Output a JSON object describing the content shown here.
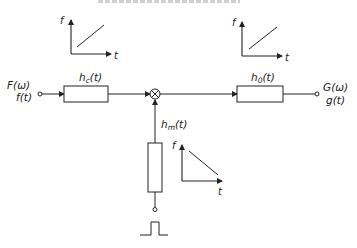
{
  "diagram": {
    "type": "block-diagram",
    "input": {
      "label_freq": "F(ω)",
      "label_time": "f(t)"
    },
    "output": {
      "label_freq": "G(ω)",
      "label_time": "g(t)"
    },
    "blocks": [
      {
        "id": "hc",
        "label": "h",
        "sub": "c",
        "arg": "(t)"
      },
      {
        "id": "h0",
        "label": "h",
        "sub": "0",
        "arg": "(t)"
      },
      {
        "id": "hm",
        "label": "h",
        "sub": "m",
        "arg": "(t)"
      }
    ],
    "multiplier_symbol": "⊗",
    "pulse_input": "rectangular-pulse",
    "insets": [
      {
        "id": "chirp-up-1",
        "y_axis": "f",
        "x_axis": "t",
        "slope": "increasing"
      },
      {
        "id": "chirp-up-2",
        "y_axis": "f",
        "x_axis": "t",
        "slope": "increasing"
      },
      {
        "id": "chirp-down",
        "y_axis": "f",
        "x_axis": "t",
        "slope": "decreasing"
      }
    ]
  }
}
